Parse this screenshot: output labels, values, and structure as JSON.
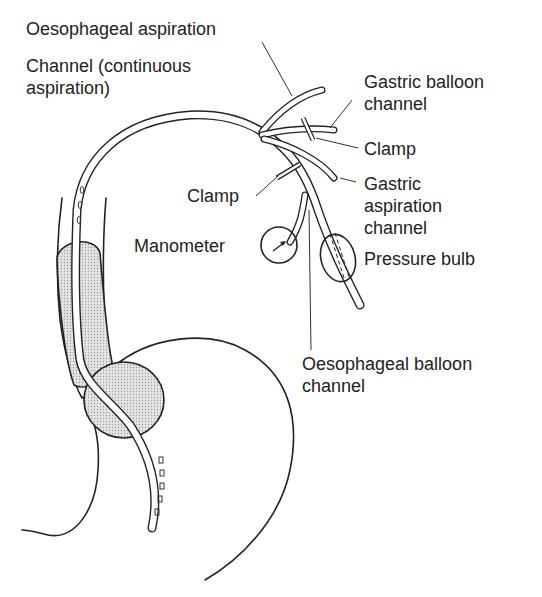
{
  "diagram": {
    "labels": {
      "oesophageal_aspiration": "Oesophageal aspiration",
      "channel_line1": "Channel (continuous",
      "channel_line2": "aspiration)",
      "gastric_balloon_line1": "Gastric balloon",
      "gastric_balloon_line2": "channel",
      "clamp_right": "Clamp",
      "gastric_aspiration_line1": "Gastric",
      "gastric_aspiration_line2": "aspiration",
      "gastric_aspiration_line3": "channel",
      "clamp_left": "Clamp",
      "manometer": "Manometer",
      "pressure_bulb": "Pressure bulb",
      "oesophageal_balloon_line1": "Oesophageal balloon",
      "oesophageal_balloon_line2": "channel"
    },
    "colors": {
      "ink": "#222222",
      "balloon_fill": "#d9d9d9",
      "background": "#ffffff"
    }
  }
}
